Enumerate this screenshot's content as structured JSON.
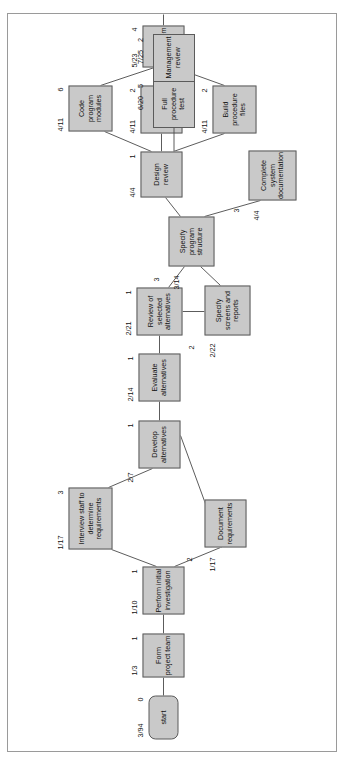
{
  "diagram": {
    "type": "pert-network",
    "orientation": "rotated-90-ccw",
    "nodes": [
      {
        "id": "start",
        "label": "start",
        "date": "3/94",
        "duration": "0",
        "shape": "rounded",
        "x": 14,
        "y": 140,
        "w": 44,
        "h": 30
      },
      {
        "id": "form_team",
        "label": "Form project team",
        "date": "1/3",
        "duration": "1",
        "shape": "rect",
        "x": 76,
        "y": 134,
        "w": 44,
        "h": 42
      },
      {
        "id": "initial_inv",
        "label": "Perform initial investigation",
        "date": "1/10",
        "duration": "1",
        "shape": "rect",
        "x": 139,
        "y": 134,
        "w": 48,
        "h": 42
      },
      {
        "id": "document_req",
        "label": "Document requirements",
        "date": "1/17",
        "duration": "2",
        "shape": "rect",
        "x": 206,
        "y": 196,
        "w": 48,
        "h": 42
      },
      {
        "id": "interview",
        "label": "Interview staff to determine requirements",
        "date": "1/17",
        "duration": "3",
        "shape": "rect",
        "x": 204,
        "y": 64,
        "w": 62,
        "h": 44
      },
      {
        "id": "develop_alt",
        "label": "Develop alternatives",
        "date": "2/7",
        "duration": "1",
        "shape": "rect",
        "x": 285,
        "y": 130,
        "w": 48,
        "h": 42
      },
      {
        "id": "evaluate_alt",
        "label": "Evaluate alternatives",
        "date": "2/14",
        "duration": "1",
        "shape": "rect",
        "x": 352,
        "y": 130,
        "w": 48,
        "h": 42
      },
      {
        "id": "review_sel",
        "label": "Review of selected alternatives",
        "date": "2/21",
        "duration": "1",
        "shape": "rect",
        "x": 418,
        "y": 128,
        "w": 48,
        "h": 46
      },
      {
        "id": "specify_screens",
        "label": "Specify screens and reports",
        "date": "2/22",
        "duration": "2",
        "shape": "rect",
        "x": 418,
        "y": 196,
        "w": 50,
        "h": 46
      },
      {
        "id": "specify_prog",
        "label": "Specify program structure",
        "date": "3/14",
        "duration": "3",
        "shape": "rect",
        "x": 487,
        "y": 160,
        "w": 50,
        "h": 46
      },
      {
        "id": "complete_doc",
        "label": "Complete system documentation",
        "date": "4/4",
        "duration": "3",
        "shape": "rect",
        "x": 553,
        "y": 240,
        "w": 50,
        "h": 48
      },
      {
        "id": "design_review",
        "label": "Design review",
        "date": "4/4",
        "duration": "1",
        "shape": "rect",
        "x": 556,
        "y": 132,
        "w": 46,
        "h": 42
      },
      {
        "id": "code_modules",
        "label": "Code program modules",
        "date": "4/11",
        "duration": "6",
        "shape": "rect",
        "x": 622,
        "y": 60,
        "w": 46,
        "h": 44
      },
      {
        "id": "build_test",
        "label": "Build test files",
        "date": "4/11",
        "duration": "2",
        "shape": "rect",
        "x": 620,
        "y": 132,
        "w": 48,
        "h": 42
      },
      {
        "id": "build_proc",
        "label": "Build procedure files",
        "date": "4/11",
        "duration": "2",
        "shape": "rect",
        "x": 620,
        "y": 204,
        "w": 48,
        "h": 44
      },
      {
        "id": "test_system",
        "label": "Test system",
        "date": "5/23",
        "duration": "4",
        "shape": "rect",
        "x": 686,
        "y": 134,
        "w": 42,
        "h": 42
      },
      {
        "id": "full_test",
        "label": "Full procedure test",
        "date": "6/20",
        "duration": "5",
        "shape": "rect",
        "x": 686,
        "y": 134,
        "w": 42,
        "h": 42
      },
      {
        "id": "mgmt_review",
        "label": "Management review",
        "date": "7/25",
        "duration": "2",
        "shape": "rect",
        "x": 686,
        "y": 134,
        "w": 42,
        "h": 42
      }
    ]
  }
}
